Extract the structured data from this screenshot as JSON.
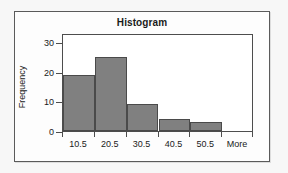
{
  "chart_data": {
    "type": "bar",
    "title": "Histogram",
    "xlabel": "",
    "ylabel": "Frequency",
    "categories": [
      "10.5",
      "20.5",
      "30.5",
      "40.5",
      "50.5",
      "More"
    ],
    "values": [
      19,
      25,
      9,
      4,
      3,
      0
    ],
    "ylim": [
      0,
      33
    ],
    "yticks": [
      0,
      10,
      20,
      30
    ],
    "ytick_labels": [
      "0",
      "10",
      "20",
      "30"
    ],
    "grid": false,
    "legend": false,
    "bar_color": "#808080",
    "bar_edge_color": "#4a4a4a",
    "plot_background": "#ffffff",
    "frame_color": "#5a5a5a",
    "text_color": "#1a1a1a"
  }
}
